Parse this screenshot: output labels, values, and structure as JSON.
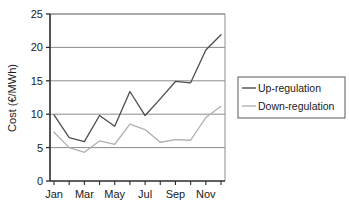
{
  "chart_data": {
    "type": "line",
    "title": "",
    "xlabel": "",
    "ylabel": "Cost (€/MWh)",
    "ylim": [
      0,
      25
    ],
    "yticks": [
      0,
      5,
      10,
      15,
      20,
      25
    ],
    "ytick_labels": [
      "0",
      "5",
      "10",
      "15",
      "20",
      "25"
    ],
    "grid": true,
    "grid_axis": "y",
    "legend_position": "right",
    "categories": [
      "Jan",
      "Feb",
      "Mar",
      "Apr",
      "May",
      "Jun",
      "Jul",
      "Aug",
      "Sep",
      "Oct",
      "Nov",
      "Dec"
    ],
    "xtick_labels": [
      "Jan",
      "",
      "Mar",
      "",
      "May",
      "",
      "Jul",
      "",
      "Sep",
      "",
      "Nov",
      ""
    ],
    "xtick_labels_visible": [
      "Jan",
      "Mar",
      "May",
      "Jul",
      "Sep",
      "Nov"
    ],
    "series": [
      {
        "name": "Up-regulation",
        "color": "#4d4d4d",
        "values": [
          9.9,
          6.5,
          5.9,
          9.8,
          8.2,
          13.4,
          9.8,
          12.3,
          14.9,
          14.7,
          19.6,
          21.9
        ]
      },
      {
        "name": "Down-regulation",
        "color": "#b0b0b0",
        "values": [
          7.3,
          5.0,
          4.3,
          6.0,
          5.5,
          8.5,
          7.7,
          5.8,
          6.2,
          6.1,
          9.5,
          11.2
        ]
      }
    ]
  },
  "legend": {
    "entries": [
      {
        "label": "Up-regulation"
      },
      {
        "label": "Down-regulation"
      }
    ]
  },
  "axes": {
    "y_title": "Cost (€/MWh)"
  },
  "colors": {
    "up_regulation": "#4d4d4d",
    "down_regulation": "#b0b0b0",
    "axis": "#2b2b2b",
    "grid": "#8c8c8c",
    "background": "#ffffff"
  }
}
